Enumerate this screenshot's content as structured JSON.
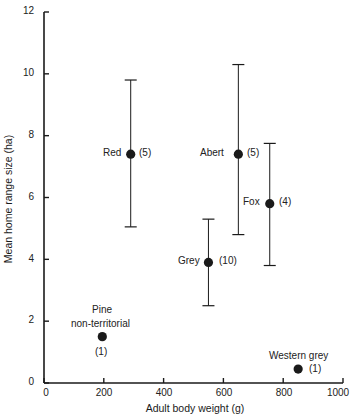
{
  "chart_data": {
    "type": "scatter",
    "title": "",
    "xlabel": "Adult body weight (g)",
    "ylabel": "Mean home range size (ha)",
    "xlim": [
      0,
      1000
    ],
    "ylim": [
      0,
      12
    ],
    "x_ticks": [
      0,
      200,
      400,
      600,
      800,
      1000
    ],
    "y_ticks": [
      0,
      2,
      4,
      6,
      8,
      10,
      12
    ],
    "grid": false,
    "legend": null,
    "points": [
      {
        "label": "Red",
        "n": "(5)",
        "x": 290,
        "y": 7.4,
        "err_low": 5.05,
        "err_high": 9.8
      },
      {
        "label": "Abert",
        "n": "(5)",
        "x": 650,
        "y": 7.4,
        "err_low": 4.8,
        "err_high": 10.3
      },
      {
        "label": "Fox",
        "n": "(4)",
        "x": 755,
        "y": 5.8,
        "err_low": 3.8,
        "err_high": 7.75
      },
      {
        "label": "Grey",
        "n": "(10)",
        "x": 550,
        "y": 3.9,
        "err_low": 2.5,
        "err_high": 5.3
      },
      {
        "label": "Pine non-territorial",
        "label_lines": [
          "Pine",
          "non-territorial"
        ],
        "n": "(1)",
        "x": 195,
        "y": 1.5,
        "err_low": null,
        "err_high": null
      },
      {
        "label": "Western grey",
        "n": "(1)",
        "x": 850,
        "y": 0.45,
        "err_low": null,
        "err_high": null
      }
    ]
  },
  "axes": {
    "x_title": "Adult body weight (g)",
    "y_title": "Mean home range size (ha)",
    "x_tick_labels": [
      "0",
      "200",
      "400",
      "600",
      "800",
      "1000"
    ],
    "y_tick_labels": [
      "0",
      "2",
      "4",
      "6",
      "8",
      "10",
      "12"
    ]
  },
  "labels": {
    "red": {
      "name": "Red",
      "n": "(5)"
    },
    "abert": {
      "name": "Abert",
      "n": "(5)"
    },
    "fox": {
      "name": "Fox",
      "n": "(4)"
    },
    "grey": {
      "name": "Grey",
      "n": "(10)"
    },
    "pine": {
      "line1": "Pine",
      "line2": "non-territorial",
      "n": "(1)"
    },
    "western_grey": {
      "name": "Western grey",
      "n": "(1)"
    }
  },
  "colors": {
    "ink": "#1a1a1a",
    "background": "#ffffff"
  }
}
